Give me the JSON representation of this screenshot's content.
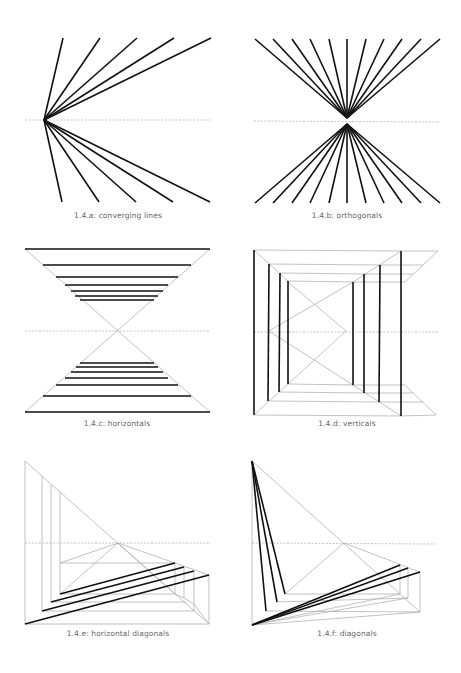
{
  "colors": {
    "background": "#ffffff",
    "thick": "#111111",
    "thin": "#a8a8a8",
    "dashed": "#9a9a9a",
    "caption": "#666666"
  },
  "figures": [
    {
      "id": "a",
      "caption": "1.4.a: converging lines",
      "caption_pos": [
        118,
        216
      ],
      "horizon": [
        [
          25,
          120
        ],
        [
          211,
          120
        ]
      ],
      "thin": [],
      "thick": [
        [
          [
            44,
            120
          ],
          [
            63,
            38
          ]
        ],
        [
          [
            44,
            120
          ],
          [
            100,
            38
          ]
        ],
        [
          [
            44,
            120
          ],
          [
            137,
            38
          ]
        ],
        [
          [
            44,
            120
          ],
          [
            174,
            38
          ]
        ],
        [
          [
            44,
            120
          ],
          [
            211,
            38
          ]
        ],
        [
          [
            44,
            120
          ],
          [
            62,
            202
          ]
        ],
        [
          [
            44,
            120
          ],
          [
            99,
            202
          ]
        ],
        [
          [
            44,
            120
          ],
          [
            136,
            202
          ]
        ],
        [
          [
            44,
            120
          ],
          [
            173,
            202
          ]
        ],
        [
          [
            44,
            120
          ],
          [
            210,
            202
          ]
        ]
      ]
    },
    {
      "id": "b",
      "caption": "1.4.b: orthogonals",
      "caption_pos": [
        347,
        216
      ],
      "horizon": [
        [
          254,
          121
        ],
        [
          440,
          122
        ]
      ],
      "thin": [],
      "thick": [
        [
          [
            347,
            118
          ],
          [
            255,
            39
          ]
        ],
        [
          [
            347,
            118
          ],
          [
            273,
            39
          ]
        ],
        [
          [
            347,
            118
          ],
          [
            292,
            39
          ]
        ],
        [
          [
            347,
            118
          ],
          [
            310,
            39
          ]
        ],
        [
          [
            347,
            118
          ],
          [
            329,
            39
          ]
        ],
        [
          [
            347,
            118
          ],
          [
            347,
            39
          ]
        ],
        [
          [
            347,
            118
          ],
          [
            366,
            39
          ]
        ],
        [
          [
            347,
            118
          ],
          [
            384,
            39
          ]
        ],
        [
          [
            347,
            118
          ],
          [
            402,
            39
          ]
        ],
        [
          [
            347,
            118
          ],
          [
            421,
            39
          ]
        ],
        [
          [
            347,
            118
          ],
          [
            440,
            39
          ]
        ],
        [
          [
            347,
            124
          ],
          [
            255,
            203
          ]
        ],
        [
          [
            347,
            124
          ],
          [
            273,
            203
          ]
        ],
        [
          [
            347,
            124
          ],
          [
            292,
            203
          ]
        ],
        [
          [
            347,
            124
          ],
          [
            310,
            203
          ]
        ],
        [
          [
            347,
            124
          ],
          [
            329,
            203
          ]
        ],
        [
          [
            347,
            124
          ],
          [
            347,
            203
          ]
        ],
        [
          [
            347,
            124
          ],
          [
            366,
            203
          ]
        ],
        [
          [
            347,
            124
          ],
          [
            384,
            203
          ]
        ],
        [
          [
            347,
            124
          ],
          [
            402,
            203
          ]
        ],
        [
          [
            347,
            124
          ],
          [
            421,
            203
          ]
        ],
        [
          [
            347,
            124
          ],
          [
            440,
            203
          ]
        ]
      ]
    },
    {
      "id": "c",
      "caption": "1.4.c: horizontals",
      "caption_pos": [
        117,
        424
      ],
      "horizon": [
        [
          25,
          331
        ],
        [
          210,
          331
        ]
      ],
      "thin": [
        [
          [
            25,
            249
          ],
          [
            210,
            412
          ]
        ],
        [
          [
            210,
            249
          ],
          [
            25,
            412
          ]
        ]
      ],
      "thick": [
        [
          [
            25,
            249
          ],
          [
            210,
            249
          ]
        ],
        [
          [
            43,
            265
          ],
          [
            191,
            265
          ]
        ],
        [
          [
            56,
            277
          ],
          [
            178,
            277
          ]
        ],
        [
          [
            65,
            285
          ],
          [
            168,
            285
          ]
        ],
        [
          [
            71,
            291
          ],
          [
            163,
            291
          ]
        ],
        [
          [
            75,
            296
          ],
          [
            158,
            296
          ]
        ],
        [
          [
            80,
            300
          ],
          [
            154,
            300
          ]
        ],
        [
          [
            80,
            363
          ],
          [
            154,
            363
          ]
        ],
        [
          [
            76,
            367
          ],
          [
            158,
            367
          ]
        ],
        [
          [
            71,
            372
          ],
          [
            163,
            372
          ]
        ],
        [
          [
            65,
            378
          ],
          [
            168,
            378
          ]
        ],
        [
          [
            56,
            385
          ],
          [
            178,
            385
          ]
        ],
        [
          [
            43,
            396
          ],
          [
            191,
            396
          ]
        ],
        [
          [
            25,
            412
          ],
          [
            210,
            412
          ]
        ]
      ]
    },
    {
      "id": "d",
      "caption": "1.4.d: verticals",
      "caption_pos": [
        347,
        424
      ],
      "horizon": [
        [
          254,
          332
        ],
        [
          438,
          332
        ]
      ],
      "thin": [
        [
          [
            254,
            250
          ],
          [
            401,
            251
          ]
        ],
        [
          [
            401,
            251
          ],
          [
            438,
            251
          ]
        ],
        [
          [
            269,
            264
          ],
          [
            380,
            265
          ]
        ],
        [
          [
            380,
            265
          ],
          [
            423,
            265
          ]
        ],
        [
          [
            280,
            273
          ],
          [
            364,
            274
          ]
        ],
        [
          [
            364,
            274
          ],
          [
            413,
            274
          ]
        ],
        [
          [
            288,
            281
          ],
          [
            353,
            282
          ]
        ],
        [
          [
            353,
            282
          ],
          [
            405,
            282
          ]
        ],
        [
          [
            254,
            415
          ],
          [
            401,
            416
          ]
        ],
        [
          [
            401,
            416
          ],
          [
            436,
            415
          ]
        ],
        [
          [
            269,
            401
          ],
          [
            380,
            402
          ]
        ],
        [
          [
            380,
            402
          ],
          [
            423,
            402
          ]
        ],
        [
          [
            280,
            392
          ],
          [
            364,
            393
          ]
        ],
        [
          [
            364,
            393
          ],
          [
            413,
            393
          ]
        ],
        [
          [
            288,
            384
          ],
          [
            353,
            385
          ]
        ],
        [
          [
            353,
            385
          ],
          [
            405,
            385
          ]
        ],
        [
          [
            254,
            250
          ],
          [
            288,
            281
          ]
        ],
        [
          [
            254,
            415
          ],
          [
            288,
            384
          ]
        ],
        [
          [
            401,
            251
          ],
          [
            353,
            282
          ]
        ],
        [
          [
            401,
            416
          ],
          [
            353,
            385
          ]
        ],
        [
          [
            438,
            251
          ],
          [
            405,
            282
          ]
        ],
        [
          [
            436,
            415
          ],
          [
            405,
            385
          ]
        ],
        [
          [
            269,
            331
          ],
          [
            353,
            282
          ]
        ],
        [
          [
            269,
            331
          ],
          [
            353,
            385
          ]
        ],
        [
          [
            288,
            282
          ],
          [
            346,
            331
          ]
        ],
        [
          [
            288,
            384
          ],
          [
            346,
            331
          ]
        ]
      ],
      "thick": [
        [
          [
            254,
            250
          ],
          [
            254,
            415
          ]
        ],
        [
          [
            269,
            264
          ],
          [
            268,
            401
          ]
        ],
        [
          [
            280,
            273
          ],
          [
            279,
            392
          ]
        ],
        [
          [
            288,
            281
          ],
          [
            288,
            384
          ]
        ],
        [
          [
            353,
            282
          ],
          [
            353,
            385
          ]
        ],
        [
          [
            364,
            274
          ],
          [
            364,
            393
          ]
        ],
        [
          [
            380,
            265
          ],
          [
            379,
            402
          ]
        ],
        [
          [
            401,
            251
          ],
          [
            401,
            416
          ]
        ]
      ]
    },
    {
      "id": "e",
      "caption": "1.4.e: horizontal diagonals",
      "caption_pos": [
        118,
        634
      ],
      "horizon": [
        [
          25,
          543
        ],
        [
          211,
          543
        ]
      ],
      "thin": [
        [
          [
            25,
            461
          ],
          [
            25,
            624
          ]
        ],
        [
          [
            25,
            461
          ],
          [
            209,
            624
          ]
        ],
        [
          [
            25,
            624
          ],
          [
            209,
            624
          ]
        ],
        [
          [
            42,
            476
          ],
          [
            42,
            611
          ]
        ],
        [
          [
            51,
            485
          ],
          [
            51,
            602
          ]
        ],
        [
          [
            60,
            492
          ],
          [
            60,
            594
          ]
        ],
        [
          [
            42,
            611
          ],
          [
            194,
            611
          ]
        ],
        [
          [
            51,
            602
          ],
          [
            186,
            602
          ]
        ],
        [
          [
            60,
            594
          ],
          [
            175,
            594
          ]
        ],
        [
          [
            60,
            563
          ],
          [
            175,
            563
          ]
        ],
        [
          [
            118,
            543
          ],
          [
            209,
            575
          ]
        ],
        [
          [
            118,
            543
          ],
          [
            60,
            594
          ]
        ],
        [
          [
            118,
            543
          ],
          [
            60,
            563
          ]
        ],
        [
          [
            118,
            543
          ],
          [
            175,
            594
          ]
        ],
        [
          [
            175,
            563
          ],
          [
            175,
            594
          ]
        ],
        [
          [
            184,
            567
          ],
          [
            184,
            598
          ]
        ],
        [
          [
            194,
            571
          ],
          [
            194,
            611
          ]
        ],
        [
          [
            209,
            575
          ],
          [
            209,
            624
          ]
        ],
        [
          [
            175,
            594
          ],
          [
            184,
            598
          ]
        ],
        [
          [
            184,
            598
          ],
          [
            194,
            604
          ]
        ],
        [
          [
            194,
            604
          ],
          [
            209,
            624
          ]
        ]
      ],
      "thick": [
        [
          [
            60,
            594
          ],
          [
            175,
            563
          ]
        ],
        [
          [
            51,
            602
          ],
          [
            184,
            567
          ]
        ],
        [
          [
            42,
            611
          ],
          [
            194,
            571
          ]
        ],
        [
          [
            25,
            624
          ],
          [
            209,
            575
          ]
        ]
      ]
    },
    {
      "id": "f",
      "caption": "1.4.f: diagonals",
      "caption_pos": [
        347,
        634
      ],
      "horizon": [
        [
          252,
          543
        ],
        [
          437,
          544
        ]
      ],
      "thin": [
        [
          [
            252,
            461
          ],
          [
            252,
            625
          ]
        ],
        [
          [
            252,
            461
          ],
          [
            400,
            594
          ]
        ],
        [
          [
            344,
            543
          ],
          [
            420,
            572
          ]
        ],
        [
          [
            344,
            543
          ],
          [
            285,
            594
          ]
        ],
        [
          [
            285,
            594
          ],
          [
            400,
            594
          ]
        ],
        [
          [
            277,
            602
          ],
          [
            408,
            598
          ]
        ],
        [
          [
            266,
            611
          ],
          [
            420,
            612
          ]
        ],
        [
          [
            252,
            625
          ],
          [
            400,
            594
          ]
        ],
        [
          [
            252,
            625
          ],
          [
            408,
            598
          ]
        ],
        [
          [
            252,
            625
          ],
          [
            420,
            612
          ]
        ],
        [
          [
            400,
            565
          ],
          [
            400,
            594
          ]
        ],
        [
          [
            408,
            568
          ],
          [
            408,
            598
          ]
        ],
        [
          [
            420,
            572
          ],
          [
            420,
            612
          ]
        ],
        [
          [
            400,
            594
          ],
          [
            420,
            612
          ]
        ]
      ],
      "thick": [
        [
          [
            252,
            461
          ],
          [
            266,
            611
          ]
        ],
        [
          [
            252,
            461
          ],
          [
            277,
            602
          ]
        ],
        [
          [
            252,
            461
          ],
          [
            285,
            594
          ]
        ],
        [
          [
            252,
            625
          ],
          [
            400,
            565
          ]
        ],
        [
          [
            252,
            625
          ],
          [
            408,
            568
          ]
        ],
        [
          [
            252,
            625
          ],
          [
            420,
            572
          ]
        ]
      ]
    }
  ]
}
